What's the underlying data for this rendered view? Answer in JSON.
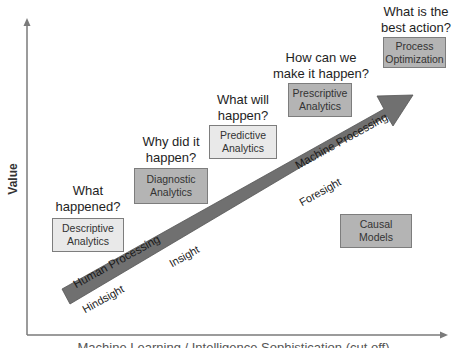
{
  "diagram": {
    "type": "analytics-maturity-diagram",
    "axes": {
      "y_label": "Value",
      "x_label": "Machine Learning / Intelligence Sophistication (cut off)"
    },
    "arrow": {
      "label_lower": "Human Processing",
      "label_upper": "Machine Processing",
      "color": "#707070"
    },
    "stage_labels": [
      "Hindsight",
      "Insight",
      "Foresight"
    ],
    "stages": [
      {
        "question_line1": "What",
        "question_line2": "happened?",
        "box_line1": "Descriptive",
        "box_line2": "Analytics",
        "shade": "light"
      },
      {
        "question_line1": "Why did it",
        "question_line2": "happen?",
        "box_line1": "Diagnostic",
        "box_line2": "Analytics",
        "shade": "mid"
      },
      {
        "question_line1": "What will",
        "question_line2": "happen?",
        "box_line1": "Predictive",
        "box_line2": "Analytics",
        "shade": "light"
      },
      {
        "question_line1": "How can we",
        "question_line2": "make it happen?",
        "box_line1": "Prescriptive",
        "box_line2": "Analytics",
        "shade": "mid"
      },
      {
        "question_line1": "What is the",
        "question_line2": "best action?",
        "box_line1": "Process",
        "box_line2": "Optimization",
        "shade": "mid"
      }
    ],
    "extra_box": {
      "line1": "Causal",
      "line2": "Models"
    },
    "colors": {
      "light_box": "#e9e9e9",
      "mid_box": "#b4b4b4",
      "box_border": "#7d7d7d",
      "axis": "#7a7a7a"
    }
  }
}
